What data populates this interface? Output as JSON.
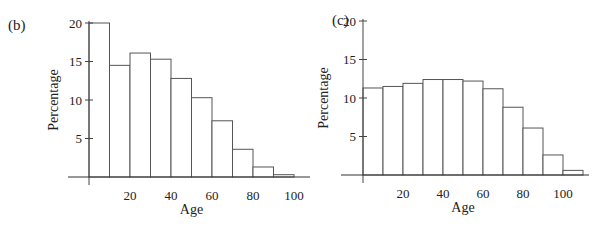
{
  "chart_data": [
    {
      "panel": "(b)",
      "type": "bar",
      "title": "",
      "xlabel": "Age",
      "ylabel": "Percentage",
      "categories": [
        "0-10",
        "10-20",
        "20-30",
        "30-40",
        "40-50",
        "50-60",
        "60-70",
        "70-80",
        "80-90",
        "90-100"
      ],
      "bin_edges": [
        0,
        10,
        20,
        30,
        40,
        50,
        60,
        70,
        80,
        90,
        100
      ],
      "values": [
        20.0,
        14.5,
        16.1,
        15.3,
        12.8,
        10.3,
        7.3,
        3.6,
        1.3,
        0.3
      ],
      "xticks": [
        20,
        40,
        60,
        80,
        100
      ],
      "yticks": [
        5,
        10,
        15,
        20
      ],
      "xlim": [
        -10,
        110
      ],
      "ylim": [
        0,
        20
      ],
      "grid": false,
      "legend": null
    },
    {
      "panel": "(c)",
      "type": "bar",
      "title": "",
      "xlabel": "Age",
      "ylabel": "Percentage",
      "categories": [
        "0-10",
        "10-20",
        "20-30",
        "30-40",
        "40-50",
        "50-60",
        "60-70",
        "70-80",
        "80-90",
        "90-100",
        "100-110"
      ],
      "bin_edges": [
        0,
        10,
        20,
        30,
        40,
        50,
        60,
        70,
        80,
        90,
        100,
        110
      ],
      "values": [
        11.3,
        11.5,
        11.9,
        12.4,
        12.4,
        12.2,
        11.2,
        8.8,
        6.1,
        2.6,
        0.6
      ],
      "xticks": [
        20,
        40,
        60,
        80,
        100
      ],
      "yticks": [
        5,
        10,
        15,
        20
      ],
      "xlim": [
        -10,
        112
      ],
      "ylim": [
        0,
        20
      ],
      "grid": false,
      "legend": null
    }
  ],
  "layout": [
    {
      "x0": 89,
      "base": 177,
      "pxPerYear": 2.05,
      "pxPerUnit": 7.7,
      "axisLeft": 68,
      "axisRight": 310,
      "panelX": 8,
      "panelY": 30,
      "ylabelX": 58
    },
    {
      "x0": 363,
      "base": 175,
      "pxPerYear": 2.0,
      "pxPerUnit": 7.7,
      "axisLeft": 341,
      "axisRight": 589,
      "panelX": 332,
      "panelY": 25,
      "ylabelX": 328
    }
  ]
}
